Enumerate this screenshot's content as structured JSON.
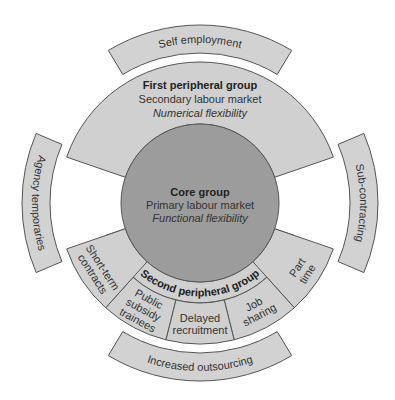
{
  "colors": {
    "core_fill": "#9c9c9c",
    "peripheral_fill": "#d0d0d0",
    "outer_fill": "#d2d2d2",
    "stroke": "#555555",
    "text": "#333333",
    "background": "#ffffff"
  },
  "geometry": {
    "center": [
      200,
      203
    ],
    "core_radius": 79,
    "inner_band_outer_radius": 100,
    "ring_outer_radius": 141,
    "outer_band_inner_radius": 150,
    "outer_band_outer_radius": 178
  },
  "core": {
    "title": "Core group",
    "line1": "Primary labour market",
    "line2": "Functional flexibility"
  },
  "first_peripheral": {
    "title": "First peripheral group",
    "line1": "Secondary labour market",
    "line2": "Numerical flexibility",
    "start_angle": 199,
    "end_angle": 341
  },
  "second_peripheral": {
    "title": "Second peripheral group",
    "start_angle": 19,
    "end_angle": 161,
    "segments": [
      {
        "label_lines": [
          "Part",
          "time"
        ],
        "start_angle": 19,
        "end_angle": 48,
        "full_depth": true
      },
      {
        "label_lines": [
          "Job",
          "sharing"
        ],
        "start_angle": 48,
        "end_angle": 76,
        "full_depth": false
      },
      {
        "label_lines": [
          "Delayed",
          "recruitment"
        ],
        "start_angle": 76,
        "end_angle": 104,
        "full_depth": false
      },
      {
        "label_lines": [
          "Public",
          "subsidy",
          "trainees"
        ],
        "start_angle": 104,
        "end_angle": 132,
        "full_depth": false
      },
      {
        "label_lines": [
          "Short-term",
          "contracts"
        ],
        "start_angle": 132,
        "end_angle": 161,
        "full_depth": true
      }
    ]
  },
  "outer_bands": [
    {
      "label": "Self employment",
      "start_angle": 239,
      "end_angle": 301,
      "position": "top"
    },
    {
      "label": "Sub-contracting",
      "start_angle": -23,
      "end_angle": 23,
      "position": "right"
    },
    {
      "label": "Increased outsourcing",
      "start_angle": 59,
      "end_angle": 121,
      "position": "bottom"
    },
    {
      "label": "Agency temporaries",
      "start_angle": 157,
      "end_angle": 203,
      "position": "left"
    }
  ]
}
